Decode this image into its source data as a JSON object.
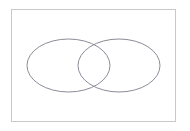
{
  "figure": {
    "kind": "venn-diagram",
    "background_color": "#ffffff",
    "clipped_caption_text": "— —— —  —— — ——— —",
    "frame": {
      "label": "figure-frame",
      "x": 11,
      "y": 9,
      "width": 165,
      "height": 113,
      "stroke_color": "#c9c9cc",
      "stroke_width": 1,
      "fill_color": "#ffffff"
    },
    "shapes": [
      {
        "name": "left-set-ellipse",
        "cx": 68.5,
        "cy": 65.5,
        "rx": 41.5,
        "ry": 26.5,
        "stroke_color": "#8c8c98",
        "stroke_width": 1,
        "fill": "none",
        "label": ""
      },
      {
        "name": "right-set-ellipse",
        "cx": 119.0,
        "cy": 65.5,
        "rx": 41.0,
        "ry": 26.5,
        "stroke_color": "#8c8c98",
        "stroke_width": 1,
        "fill": "none",
        "label": ""
      }
    ],
    "intersection": {
      "name": "set-intersection-lens",
      "top_vertex_x": 94,
      "top_vertex_y": 48,
      "bottom_vertex_x": 94,
      "bottom_vertex_y": 84,
      "label": ""
    }
  }
}
